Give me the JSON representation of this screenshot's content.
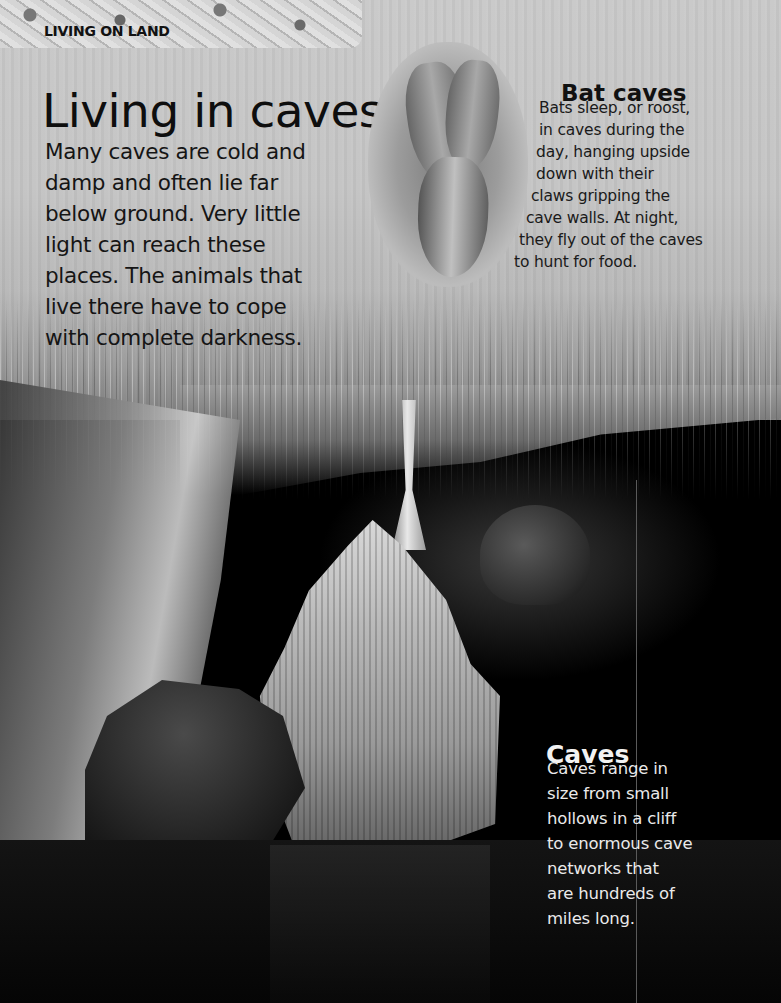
{
  "header": {
    "section_label": "LIVING ON LAND"
  },
  "main": {
    "title": "Living in caves",
    "intro_lines": [
      "Many caves are cold and",
      "damp and often lie far",
      "below ground. Very little",
      "light can reach these",
      "places. The animals that",
      "live there have to cope",
      "with complete darkness."
    ]
  },
  "bat_caves": {
    "heading": "Bat caves",
    "body_lines": [
      "Bats sleep, or roost,",
      "in caves during the",
      "day, hanging upside",
      "down with their",
      "claws gripping the",
      "cave walls. At night,",
      "they fly out of the caves",
      "to hunt for food."
    ],
    "illustration": "roosting-bats-illustration"
  },
  "caves": {
    "heading": "Caves",
    "body_lines": [
      "Caves range in",
      "size from small",
      "hollows in a cliff",
      "to enormous cave",
      "networks that",
      "are hundreds of",
      "miles long."
    ]
  },
  "background": {
    "photo": "cave-stalactites-photo",
    "tone": "grayscale"
  }
}
